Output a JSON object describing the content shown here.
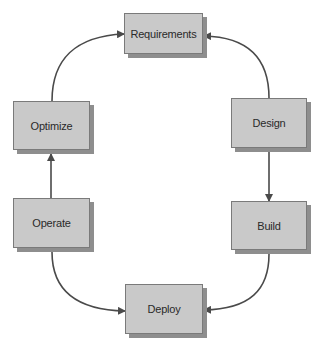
{
  "diagram": {
    "type": "cycle",
    "nodes": [
      {
        "id": "requirements",
        "label": "Requirements"
      },
      {
        "id": "design",
        "label": "Design"
      },
      {
        "id": "build",
        "label": "Build"
      },
      {
        "id": "deploy",
        "label": "Deploy"
      },
      {
        "id": "operate",
        "label": "Operate"
      },
      {
        "id": "optimize",
        "label": "Optimize"
      }
    ],
    "edges": [
      {
        "from": "design",
        "to": "requirements"
      },
      {
        "from": "design",
        "to": "build"
      },
      {
        "from": "build",
        "to": "deploy"
      },
      {
        "from": "operate",
        "to": "deploy"
      },
      {
        "from": "operate",
        "to": "optimize"
      },
      {
        "from": "optimize",
        "to": "requirements"
      }
    ],
    "colors": {
      "node_fill": "#c9c9c9",
      "node_border": "#7a7a7a",
      "node_shadow": "#8e8e8e",
      "arrow": "#4a4a4a",
      "text": "#2a2a2a"
    }
  }
}
